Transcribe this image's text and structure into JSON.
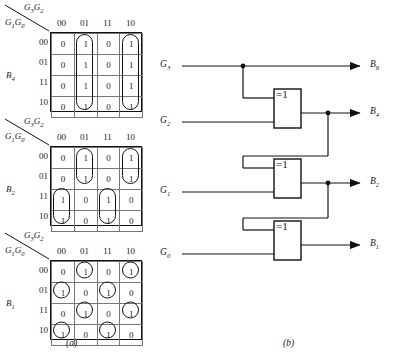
{
  "figure": {
    "caption_a": "(a)",
    "caption_b": "(b)"
  },
  "kmaps": [
    {
      "name": "B4",
      "output_label": "B",
      "output_sub": "4",
      "top_vars": "G3G2",
      "top_var_main": "G",
      "side_vars": "G1G0",
      "col_headers": [
        "00",
        "01",
        "11",
        "10"
      ],
      "row_headers": [
        "00",
        "01",
        "11",
        "10"
      ],
      "cells": [
        [
          "0",
          "1",
          "0",
          "1"
        ],
        [
          "0",
          "1",
          "0",
          "1"
        ],
        [
          "0",
          "1",
          "0",
          "1"
        ],
        [
          "0",
          "1",
          "0",
          "1"
        ]
      ],
      "groups": [
        {
          "shape": "rect",
          "col": 1,
          "row": 0,
          "cols": 1,
          "rows": 4
        },
        {
          "shape": "rect",
          "col": 3,
          "row": 0,
          "cols": 1,
          "rows": 4
        }
      ]
    },
    {
      "name": "B2",
      "output_label": "B",
      "output_sub": "2",
      "top_vars": "G3G2",
      "side_vars": "G1G0",
      "col_headers": [
        "00",
        "01",
        "11",
        "10"
      ],
      "row_headers": [
        "00",
        "01",
        "11",
        "10"
      ],
      "cells": [
        [
          "0",
          "1",
          "0",
          "1"
        ],
        [
          "0",
          "1",
          "0",
          "1"
        ],
        [
          "1",
          "0",
          "1",
          "0"
        ],
        [
          "1",
          "0",
          "1",
          "0"
        ]
      ],
      "groups": [
        {
          "shape": "rect",
          "col": 1,
          "row": 0,
          "cols": 1,
          "rows": 2
        },
        {
          "shape": "rect",
          "col": 3,
          "row": 0,
          "cols": 1,
          "rows": 2
        },
        {
          "shape": "rect",
          "col": 0,
          "row": 2,
          "cols": 1,
          "rows": 2
        },
        {
          "shape": "rect",
          "col": 2,
          "row": 2,
          "cols": 1,
          "rows": 2
        }
      ]
    },
    {
      "name": "B1",
      "output_label": "B",
      "output_sub": "1",
      "top_vars": "G3G2",
      "side_vars": "G1G0",
      "col_headers": [
        "00",
        "01",
        "11",
        "10"
      ],
      "row_headers": [
        "00",
        "01",
        "11",
        "10"
      ],
      "cells": [
        [
          "0",
          "1",
          "0",
          "1"
        ],
        [
          "1",
          "0",
          "1",
          "0"
        ],
        [
          "0",
          "1",
          "0",
          "1"
        ],
        [
          "1",
          "0",
          "1",
          "0"
        ]
      ],
      "groups": [
        {
          "shape": "circle",
          "col": 1,
          "row": 0
        },
        {
          "shape": "circle",
          "col": 3,
          "row": 0
        },
        {
          "shape": "circle",
          "col": 0,
          "row": 1
        },
        {
          "shape": "circle",
          "col": 2,
          "row": 1
        },
        {
          "shape": "circle",
          "col": 1,
          "row": 2
        },
        {
          "shape": "circle",
          "col": 3,
          "row": 2
        },
        {
          "shape": "circle",
          "col": 0,
          "row": 3
        },
        {
          "shape": "circle",
          "col": 2,
          "row": 3
        }
      ]
    }
  ],
  "circuit": {
    "gate_symbol": "=1",
    "inputs": [
      {
        "label": "G",
        "sub": "3",
        "y": 14
      },
      {
        "label": "G",
        "sub": "2",
        "y": 70
      },
      {
        "label": "G",
        "sub": "1",
        "y": 140
      },
      {
        "label": "G",
        "sub": "0",
        "y": 202
      }
    ],
    "outputs": [
      {
        "label": "B",
        "sub": "8",
        "y": 14
      },
      {
        "label": "B",
        "sub": "4",
        "y": 61
      },
      {
        "label": "B",
        "sub": "2",
        "y": 131
      },
      {
        "label": "B",
        "sub": "1",
        "y": 193
      }
    ],
    "gates": [
      {
        "name": "xor-gate-1",
        "symbol": "=1"
      },
      {
        "name": "xor-gate-2",
        "symbol": "=1"
      },
      {
        "name": "xor-gate-3",
        "symbol": "=1"
      }
    ]
  },
  "colors": {
    "line": "#111111",
    "grid": "#777777",
    "background": "#ffffff"
  }
}
